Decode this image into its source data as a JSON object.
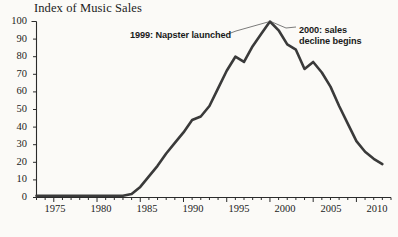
{
  "chart_data": {
    "type": "line",
    "title": "Index of Music Sales",
    "xlabel": "",
    "ylabel": "",
    "xlim": [
      1973,
      2014
    ],
    "ylim": [
      0,
      100
    ],
    "yticks": [
      0,
      10,
      20,
      30,
      40,
      50,
      60,
      70,
      80,
      90,
      100
    ],
    "xticks": [
      1975,
      1980,
      1985,
      1990,
      1995,
      2000,
      2005,
      2010
    ],
    "xtick_minor_step": 1,
    "grid": false,
    "legend": null,
    "line_color": "#3a3a3a",
    "line_width": 2.6,
    "x": [
      1973,
      1974,
      1975,
      1976,
      1977,
      1978,
      1979,
      1980,
      1981,
      1982,
      1983,
      1984,
      1985,
      1986,
      1987,
      1988,
      1989,
      1990,
      1991,
      1992,
      1993,
      1994,
      1995,
      1996,
      1997,
      1998,
      1999,
      2000,
      2001,
      2002,
      2003,
      2004,
      2005,
      2006,
      2007,
      2008,
      2009,
      2010,
      2011,
      2012,
      2013
    ],
    "values": [
      1,
      1,
      1,
      1,
      1,
      1,
      1,
      1,
      1,
      1,
      1,
      2,
      6,
      12,
      18,
      25,
      31,
      37,
      44,
      46,
      52,
      62,
      72,
      80,
      77,
      86,
      93,
      100,
      95,
      87,
      84,
      73,
      77,
      71,
      63,
      52,
      42,
      32,
      26,
      22,
      19
    ],
    "annotations": [
      {
        "name": "napster-annotation",
        "text": "1999: Napster launched",
        "lines": [
          "1999: Napster launched"
        ],
        "target_year": 2000,
        "target_value": 100
      },
      {
        "name": "decline-annotation",
        "text": "2000: sales decline begins",
        "lines": [
          "2000: sales",
          "decline begins"
        ],
        "target_year": 2000,
        "target_value": 100
      }
    ]
  },
  "axis": {
    "y_tick_labels": [
      "100",
      "90",
      "80",
      "70",
      "60",
      "50",
      "40",
      "30",
      "20",
      "10",
      "0"
    ],
    "x_tick_labels": [
      "1975",
      "1980",
      "1985",
      "1990",
      "1995",
      "2000",
      "2005",
      "2010"
    ]
  },
  "annotations": {
    "left": "1999: Napster launched",
    "right_line1": "2000: sales",
    "right_line2": "decline begins"
  },
  "colors": {
    "line": "#3a3a3a",
    "axis": "#2b2b2b",
    "text": "#1c1c1c",
    "background": "#fbfaf7"
  }
}
